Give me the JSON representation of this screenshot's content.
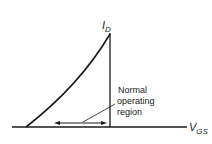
{
  "diagram": {
    "y_axis_label": {
      "main": "I",
      "sub": "D"
    },
    "x_axis_label": {
      "main": "V",
      "sub": "GS"
    },
    "annotation": [
      "Normal",
      "operating",
      "region"
    ]
  }
}
